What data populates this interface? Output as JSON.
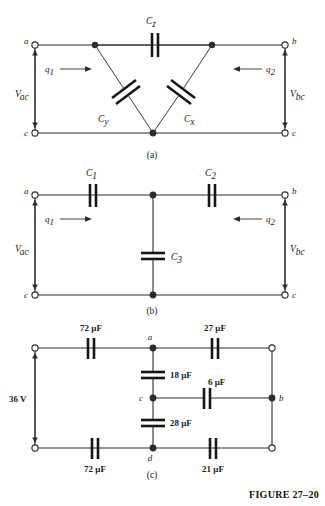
{
  "figure": {
    "caption": "FIGURE 27–20",
    "panels": [
      {
        "id": "a",
        "label": "(a)"
      },
      {
        "id": "b",
        "label": "(b)"
      },
      {
        "id": "c",
        "label": "(c)"
      }
    ]
  },
  "panel_a": {
    "panel_label": "(a)",
    "terminals": {
      "top_left": "a",
      "top_right": "b",
      "bottom_left": "c",
      "bottom_right": "c"
    },
    "capacitors": {
      "top": {
        "symbol": "C",
        "subscript": "z"
      },
      "left_diagonal": {
        "symbol": "C",
        "subscript": "y"
      },
      "right_diagonal": {
        "symbol": "C",
        "subscript": "x"
      }
    },
    "charges": {
      "left": {
        "symbol": "q",
        "subscript": "1",
        "direction": "right"
      },
      "right": {
        "symbol": "q",
        "subscript": "2",
        "direction": "left"
      }
    },
    "voltages": {
      "left": {
        "symbol": "V",
        "subscript": "ac"
      },
      "right": {
        "symbol": "V",
        "subscript": "bc"
      }
    }
  },
  "panel_b": {
    "panel_label": "(b)",
    "terminals": {
      "top_left": "a",
      "top_right": "b",
      "bottom_left": "c",
      "bottom_right": "c"
    },
    "capacitors": {
      "top_left": {
        "symbol": "C",
        "subscript": "1"
      },
      "top_right": {
        "symbol": "C",
        "subscript": "2"
      },
      "middle": {
        "symbol": "C",
        "subscript": "3"
      }
    },
    "charges": {
      "left": {
        "symbol": "q",
        "subscript": "1",
        "direction": "right"
      },
      "right": {
        "symbol": "q",
        "subscript": "2",
        "direction": "left"
      }
    },
    "voltages": {
      "left": {
        "symbol": "V",
        "subscript": "ac"
      },
      "right": {
        "symbol": "V",
        "subscript": "bc"
      }
    }
  },
  "panel_c": {
    "panel_label": "(c)",
    "source": {
      "value": "36 V"
    },
    "nodes": {
      "a": "a",
      "b": "b",
      "c": "c",
      "d": "d"
    },
    "capacitors": {
      "top_left": "72 μF",
      "top_right": "27 μF",
      "mid_upper": "18 μF",
      "mid_right": "6 μF",
      "mid_lower": "28 μF",
      "bottom_left": "72 μF",
      "bottom_right": "21 μF"
    }
  },
  "colors": {
    "ink": "#1a1a1a",
    "wire": "#2b2b2b",
    "plate": "#151515",
    "paper": "#ffffff"
  }
}
